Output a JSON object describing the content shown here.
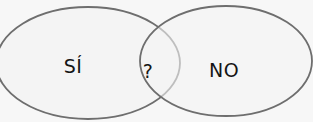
{
  "diagram": {
    "type": "venn",
    "sets": [
      {
        "id": "left",
        "label": "SÍ"
      },
      {
        "id": "right",
        "label": "NO"
      }
    ],
    "intersection": {
      "label": "?"
    },
    "colors": {
      "background": "#f7f7f7",
      "fill": "#f4f4f4",
      "stroke": "#6e6e6e",
      "text": "#151515"
    }
  }
}
